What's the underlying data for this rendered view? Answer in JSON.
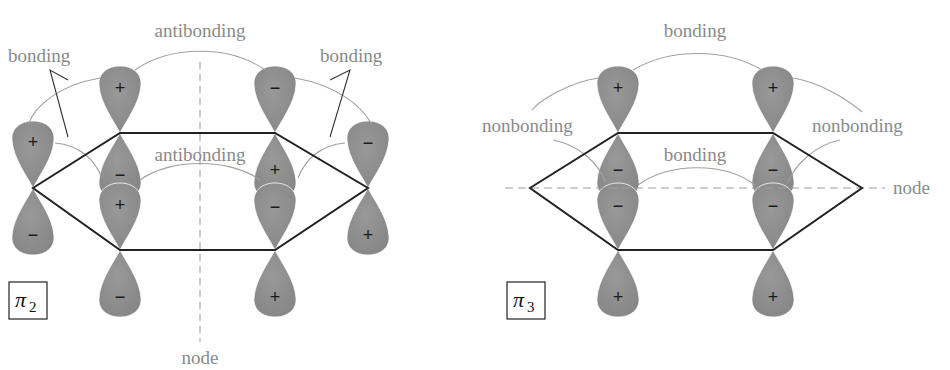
{
  "diagrams": [
    {
      "id": "pi2",
      "symbol": "π",
      "subscript": "2",
      "labels": {
        "top_center": "antibonding",
        "top_left": "bonding",
        "top_right": "bonding",
        "inner_center": "antibonding",
        "node": "node"
      },
      "node_orientation": "vertical",
      "carbons": [
        {
          "position": "upper-left",
          "top_sign": "+",
          "bottom_sign": "−"
        },
        {
          "position": "upper-right",
          "top_sign": "−",
          "bottom_sign": "+"
        },
        {
          "position": "right",
          "top_sign": "−",
          "bottom_sign": "+"
        },
        {
          "position": "lower-right",
          "top_sign": "−",
          "bottom_sign": "+"
        },
        {
          "position": "lower-left",
          "top_sign": "+",
          "bottom_sign": "−"
        },
        {
          "position": "left",
          "top_sign": "+",
          "bottom_sign": "−"
        }
      ]
    },
    {
      "id": "pi3",
      "symbol": "π",
      "subscript": "3",
      "labels": {
        "top_center": "bonding",
        "left": "nonbonding",
        "right": "nonbonding",
        "inner_center": "bonding",
        "node": "node"
      },
      "node_orientation": "horizontal",
      "carbons": [
        {
          "position": "upper-left",
          "top_sign": "+",
          "bottom_sign": "−"
        },
        {
          "position": "upper-right",
          "top_sign": "+",
          "bottom_sign": "−"
        },
        {
          "position": "right",
          "top_sign": "",
          "bottom_sign": ""
        },
        {
          "position": "lower-right",
          "top_sign": "−",
          "bottom_sign": "+"
        },
        {
          "position": "lower-left",
          "top_sign": "−",
          "bottom_sign": "+"
        },
        {
          "position": "left",
          "top_sign": "",
          "bottom_sign": ""
        }
      ]
    }
  ],
  "colors": {
    "lobe": "#8c8c8c",
    "lobe_edge": "#7a7a7a",
    "bond": "#222222",
    "label": "#8a8a8a",
    "interaction_line": "#9a9a9a",
    "node_line": "#a0a0a0"
  }
}
